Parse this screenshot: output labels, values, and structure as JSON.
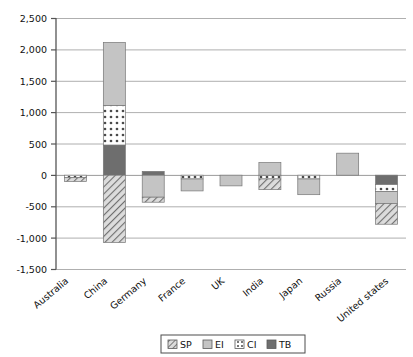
{
  "chart_data": {
    "type": "bar",
    "title": "",
    "subtitle": "",
    "xlabel": "",
    "ylabel": "",
    "stacked": true,
    "grid": true,
    "orientation": "vertical",
    "legend_position": "bottom",
    "ylim": [
      -1500,
      2500
    ],
    "yticks": [
      2500,
      2000,
      1500,
      1000,
      500,
      0,
      -500,
      -1000,
      -1500
    ],
    "ytick_labels": [
      "2,500",
      "2,000",
      "1,500",
      "1,000",
      "500",
      "0",
      "-500",
      "-1,000",
      "-1,500"
    ],
    "categories": [
      "Australia",
      "China",
      "Germany",
      "France",
      "UK",
      "India",
      "Japan",
      "Russia",
      "United states"
    ],
    "series": [
      {
        "name": "SP",
        "pattern": "diagonal-hatch",
        "color": "#c9c9c9",
        "values": [
          -60,
          -1070,
          -80,
          0,
          0,
          -170,
          0,
          0,
          -330
        ]
      },
      {
        "name": "EI",
        "pattern": "solid-light",
        "color": "#c4c4c4",
        "values": [
          0,
          1000,
          -350,
          -190,
          -170,
          200,
          -250,
          350,
          -190
        ]
      },
      {
        "name": "CI",
        "pattern": "dotted",
        "color": "#ffffff",
        "values": [
          -40,
          630,
          0,
          -60,
          0,
          -60,
          -60,
          0,
          -110
        ]
      },
      {
        "name": "TB",
        "pattern": "solid-dark",
        "color": "#6e6e6e",
        "values": [
          0,
          480,
          60,
          0,
          0,
          0,
          0,
          0,
          -150
        ]
      }
    ]
  },
  "legend": {
    "items": [
      {
        "label": "SP",
        "swatch": "diagonal-hatch"
      },
      {
        "label": "EI",
        "swatch": "solid-light"
      },
      {
        "label": "CI",
        "swatch": "dotted"
      },
      {
        "label": "TB",
        "swatch": "solid-dark"
      }
    ]
  },
  "colors": {
    "axis": "#555555",
    "grid": "#9a9a9a",
    "plot_border": "#555555",
    "light_gray": "#c4c4c4",
    "dark_gray": "#6e6e6e",
    "hatch_bg": "#dcdcdc",
    "hatch_line": "#737373",
    "dot_bg": "#ffffff",
    "dot_color": "#4a4a4a",
    "text": "#111111"
  },
  "yticks": {
    "t0": "2,500",
    "t1": "2,000",
    "t2": "1,500",
    "t3": "1,000",
    "t4": "500",
    "t5": "0",
    "t6": "-500",
    "t7": "-1,000",
    "t8": "-1,500"
  },
  "categories": {
    "c0": "Australia",
    "c1": "China",
    "c2": "Germany",
    "c3": "France",
    "c4": "UK",
    "c5": "India",
    "c6": "Japan",
    "c7": "Russia",
    "c8": "United states"
  },
  "legend_labels": {
    "l0": "SP",
    "l1": "EI",
    "l2": "CI",
    "l3": "TB"
  }
}
